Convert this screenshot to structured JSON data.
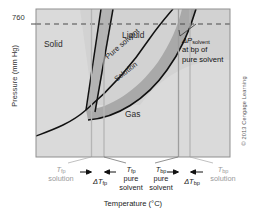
{
  "figure": {
    "credit": "© 2013 Cengage Learning"
  },
  "axes": {
    "ylabel": "Pressure (mm Hg)",
    "xlabel": "Temperature (°C)",
    "yticks": [
      "760"
    ],
    "ytick_760": "760"
  },
  "regions": {
    "solid": "Solid",
    "liquid": "Liquid",
    "gas": "Gas"
  },
  "curves": {
    "pure_solvent": "Pure solvent",
    "solution": "Solution"
  },
  "annotations": {
    "delta_p_symbol": "ΔP",
    "delta_p_sub": "solvent",
    "delta_p_line2": "at bp of",
    "delta_p_line3": "pure solvent"
  },
  "ticks": {
    "tfp_solution": {
      "sym": "T",
      "sub": "fp",
      "line2": "solution"
    },
    "delta_tfp": {
      "sym": "ΔT",
      "sub": "fp"
    },
    "tfp_pure": {
      "sym": "T",
      "sub": "fp",
      "line2": "pure",
      "line3": "solvent"
    },
    "tbp_pure": {
      "sym": "T",
      "sub": "bp",
      "line2": "pure",
      "line3": "solvent"
    },
    "delta_tbp": {
      "sym": "ΔT",
      "sub": "bp"
    },
    "tbp_solution": {
      "sym": "T",
      "sub": "bp",
      "line2": "solution"
    }
  },
  "colors": {
    "plot_fill": "#d9d9d9",
    "band_fill": "#a8a8a8",
    "curve": "#111111",
    "frame": "#8a8a8a",
    "guide": "#bdbdbd",
    "muted_text": "#9a9a9a"
  }
}
